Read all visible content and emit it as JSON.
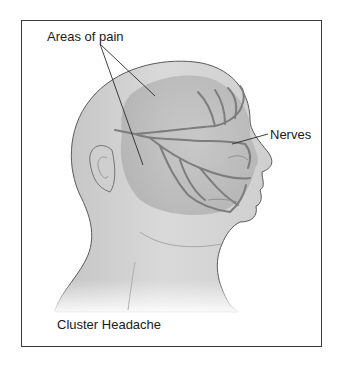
{
  "figure": {
    "title": "Cluster Headache",
    "labels": {
      "areas_of_pain": "Areas of pain",
      "nerves": "Nerves"
    },
    "colors": {
      "skin": "#d2d2d2",
      "skin_shadow": "#a9a9a9",
      "outline": "#5a5a5a",
      "nerve": "#7d7d7d",
      "frame": "#3a3a3a",
      "background": "#ffffff"
    }
  }
}
